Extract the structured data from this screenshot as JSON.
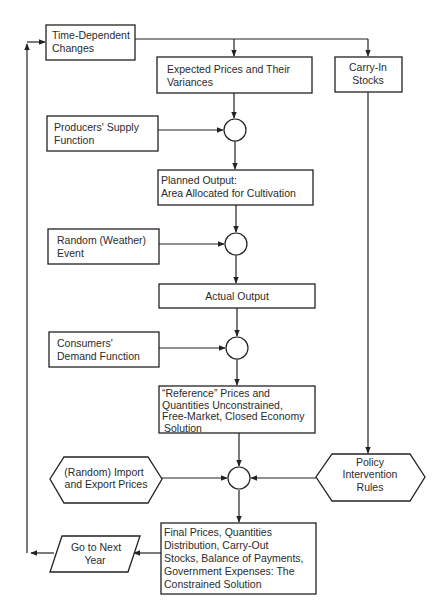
{
  "diagram": {
    "type": "flowchart",
    "nodes": [
      {
        "id": "time_dependent",
        "shape": "rect",
        "lines": [
          "Time-Dependent",
          "Changes"
        ]
      },
      {
        "id": "expected_prices",
        "shape": "rect",
        "lines": [
          "Expected Prices and Their",
          "Variances"
        ]
      },
      {
        "id": "carry_in",
        "shape": "rect",
        "lines": [
          "Carry-In",
          "Stocks"
        ]
      },
      {
        "id": "producers_supply",
        "shape": "rect",
        "lines": [
          "Producers' Supply",
          "Function"
        ]
      },
      {
        "id": "planned_output",
        "shape": "rect",
        "lines": [
          "Planned Output:",
          "Area Allocated for Cultivation"
        ]
      },
      {
        "id": "random_weather",
        "shape": "rect",
        "lines": [
          "Random (Weather)",
          "Event"
        ]
      },
      {
        "id": "actual_output",
        "shape": "rect",
        "lines": [
          "Actual Output"
        ]
      },
      {
        "id": "consumers_demand",
        "shape": "rect",
        "lines": [
          "Consumers'",
          "Demand Function"
        ]
      },
      {
        "id": "reference_prices",
        "shape": "rect",
        "lines": [
          "“Reference” Prices and",
          "Quantities Unconstrained,",
          "Free-Market, Closed Economy",
          "Solution"
        ]
      },
      {
        "id": "import_export",
        "shape": "hexagon",
        "lines": [
          "(Random) Import",
          "and Export Prices"
        ]
      },
      {
        "id": "policy_rules",
        "shape": "hexagon",
        "lines": [
          "Policy",
          "Intervention",
          "Rules"
        ]
      },
      {
        "id": "final_prices",
        "shape": "rect",
        "lines": [
          "Final Prices, Quantities",
          "Distribution, Carry-Out",
          "Stocks, Balance of Payments,",
          "Government Expenses: The",
          "Constrained Solution"
        ]
      },
      {
        "id": "next_year",
        "shape": "parallelogram",
        "lines": [
          "Go to Next",
          "Year"
        ]
      },
      {
        "id": "junction_1",
        "shape": "circle",
        "lines": []
      },
      {
        "id": "junction_2",
        "shape": "circle",
        "lines": []
      },
      {
        "id": "junction_3",
        "shape": "circle",
        "lines": []
      },
      {
        "id": "junction_4",
        "shape": "circle",
        "lines": []
      }
    ],
    "edges": [
      {
        "from": "time_dependent",
        "to": "expected_prices"
      },
      {
        "from": "time_dependent",
        "to": "carry_in"
      },
      {
        "from": "expected_prices",
        "to": "junction_1"
      },
      {
        "from": "producers_supply",
        "to": "junction_1"
      },
      {
        "from": "junction_1",
        "to": "planned_output"
      },
      {
        "from": "planned_output",
        "to": "junction_2"
      },
      {
        "from": "random_weather",
        "to": "junction_2"
      },
      {
        "from": "junction_2",
        "to": "actual_output"
      },
      {
        "from": "actual_output",
        "to": "junction_3"
      },
      {
        "from": "consumers_demand",
        "to": "junction_3"
      },
      {
        "from": "junction_3",
        "to": "reference_prices"
      },
      {
        "from": "reference_prices",
        "to": "junction_4"
      },
      {
        "from": "import_export",
        "to": "junction_4"
      },
      {
        "from": "carry_in",
        "to": "policy_rules"
      },
      {
        "from": "policy_rules",
        "to": "junction_4"
      },
      {
        "from": "junction_4",
        "to": "final_prices"
      },
      {
        "from": "final_prices",
        "to": "next_year"
      },
      {
        "from": "next_year",
        "to": "time_dependent"
      }
    ]
  }
}
